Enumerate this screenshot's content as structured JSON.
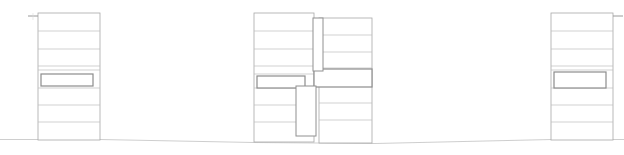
{
  "drawing": {
    "type": "architectural-elevation",
    "title": "Building Elevation",
    "canvas": {
      "width": 624,
      "height": 155
    },
    "background_color": "#ffffff",
    "colors": {
      "thin_line": "#b9b9b9",
      "outline": "#a8a8a8",
      "floor_line": "#bdbdbd",
      "ground_line": "#c2c2c2",
      "band_stroke": "#8c8c8c",
      "slab_stroke": "#909090",
      "tick": "#9a9a9a",
      "faint": "#dcdcdc"
    },
    "ground": {
      "label": "ground-line",
      "segments": [
        {
          "x1": 0,
          "y1": 139.5,
          "x2": 38,
          "y2": 139.5
        },
        {
          "x1": 38,
          "y1": 139.5,
          "x2": 100,
          "y2": 139.5
        },
        {
          "x1": 100,
          "y1": 139.5,
          "x2": 254,
          "y2": 142.5
        },
        {
          "x1": 254,
          "y1": 142.5,
          "x2": 318,
          "y2": 143.0
        },
        {
          "x1": 318,
          "y1": 143.0,
          "x2": 375,
          "y2": 143.5
        },
        {
          "x1": 375,
          "y1": 143.5,
          "x2": 552,
          "y2": 139.5
        },
        {
          "x1": 552,
          "y1": 139.5,
          "x2": 624,
          "y2": 139.5
        }
      ]
    },
    "blocks": [
      {
        "id": "left-block",
        "label": "Left Building Block",
        "x": 38,
        "y": 13,
        "width": 62,
        "height": 127,
        "floor_count": 7,
        "floor_lines_y": [
          31,
          49,
          66,
          70,
          88,
          105,
          122
        ],
        "band": {
          "label": "Highlighted Band",
          "x": 41,
          "y": 74,
          "width": 52,
          "height": 12
        },
        "tick": {
          "label": "Top Left Tick",
          "x1": 28,
          "y1": 16,
          "x2": 38,
          "y2": 16,
          "vx": 33,
          "vy1": 13,
          "vy2": 20
        }
      },
      {
        "id": "center-block",
        "label": "Center Building Block",
        "x": 254,
        "y": 13,
        "width": 118,
        "height": 130,
        "left_pane": {
          "x": 254,
          "y": 13,
          "width": 60,
          "height": 129
        },
        "right_pane": {
          "x": 319,
          "y": 18,
          "width": 53,
          "height": 125
        },
        "floor_lines_left_y": [
          31,
          49,
          66,
          74,
          88,
          105,
          122
        ],
        "floor_lines_right_y": [
          35,
          52,
          68,
          86,
          103,
          120
        ],
        "bands": [
          {
            "label": "Left Band",
            "x": 257,
            "y": 76,
            "width": 48,
            "height": 12
          },
          {
            "label": "Right Band",
            "x": 314,
            "y": 69,
            "width": 58,
            "height": 18
          }
        ],
        "slabs": [
          {
            "label": "Upper Vertical Slab",
            "x": 313,
            "y": 18,
            "width": 10,
            "height": 53
          },
          {
            "label": "Lower Vertical Slab",
            "x": 296,
            "y": 86,
            "width": 20,
            "height": 50
          }
        ]
      },
      {
        "id": "right-block",
        "label": "Right Building Block",
        "x": 551,
        "y": 13,
        "width": 62,
        "height": 127,
        "floor_count": 7,
        "floor_lines_y": [
          31,
          49,
          66,
          70,
          88,
          105,
          122
        ],
        "band": {
          "label": "Highlighted Band",
          "x": 554,
          "y": 72,
          "width": 52,
          "height": 16
        },
        "tick": {
          "label": "Top Right Tick",
          "x1": 613,
          "y1": 16,
          "x2": 623,
          "y2": 16
        }
      }
    ]
  }
}
